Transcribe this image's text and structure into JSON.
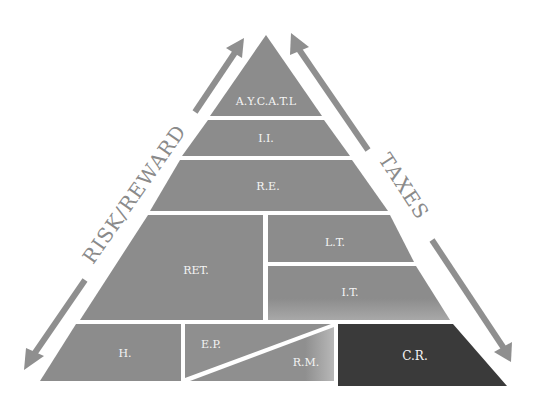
{
  "diagram": {
    "type": "pyramid",
    "axes": {
      "left": {
        "label": "RISK/REWARD",
        "direction": "bidirectional"
      },
      "right": {
        "label": "TAXES",
        "direction": "bidirectional"
      }
    },
    "layers": [
      {
        "label": "A.Y.C.A.T.L",
        "row": 1
      },
      {
        "label": "I.I.",
        "row": 2
      },
      {
        "label": "R.E.",
        "row": 3
      },
      {
        "label": "RET.",
        "row": 4
      },
      {
        "label": "L.T.",
        "row": 4
      },
      {
        "label": "I.T.",
        "row": 4
      },
      {
        "label": "H.",
        "row": 5
      },
      {
        "label": "E.P.",
        "row": 5
      },
      {
        "label": "R.M.",
        "row": 5
      },
      {
        "label": "C.R.",
        "row": 5
      }
    ],
    "colors": {
      "block": "#8c8c8c",
      "block_dark": "#3a3a3a",
      "arrow": "#8f8f8f",
      "divider": "#ffffff",
      "label": "#f4f4f4"
    }
  }
}
